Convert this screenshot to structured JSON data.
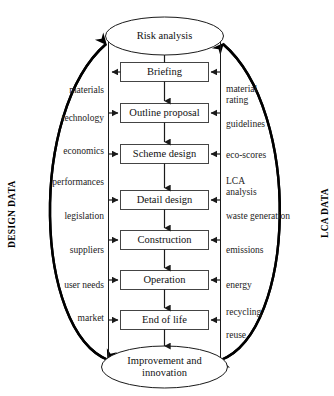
{
  "diagram": {
    "title_top": "Risk analysis",
    "title_bottom_line1": "Improvement and",
    "title_bottom_line2": "innovation",
    "axis_left": "DESIGN DATA",
    "axis_right": "LCA DATA",
    "line_color": "#1a1a1a",
    "box_fill": "#ffffff",
    "text_color": "#111111",
    "stages": [
      {
        "label": "Briefing"
      },
      {
        "label": "Outline proposal"
      },
      {
        "label": "Scheme design"
      },
      {
        "label": "Detail design"
      },
      {
        "label": "Construction"
      },
      {
        "label": "Operation"
      },
      {
        "label": "End of life"
      }
    ],
    "left_inputs": [
      {
        "label": "materials"
      },
      {
        "label": "technology"
      },
      {
        "label": "economics"
      },
      {
        "label": "performances"
      },
      {
        "label": "legislation"
      },
      {
        "label": "suppliers"
      },
      {
        "label": "user needs"
      },
      {
        "label": "market"
      }
    ],
    "right_inputs": [
      {
        "label": "material\nrating"
      },
      {
        "label": "guidelines"
      },
      {
        "label": "eco-scores"
      },
      {
        "label": "LCA\nanalysis"
      },
      {
        "label": "waste generation"
      },
      {
        "label": "emissions"
      },
      {
        "label": "energy"
      },
      {
        "label": "recycling"
      },
      {
        "label": "reuse"
      }
    ]
  }
}
